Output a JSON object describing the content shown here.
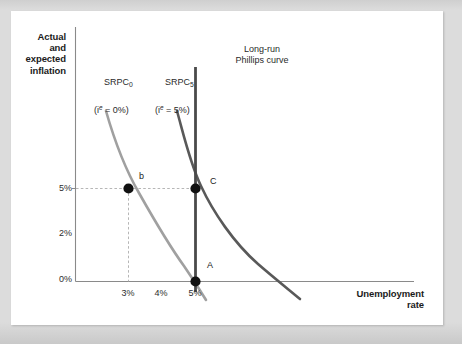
{
  "figure": {
    "background_color": "#dcdcdc",
    "card_color": "#ffffff"
  },
  "axes": {
    "y_title": "Actual\nand\nexpected\ninflation",
    "x_title": "Unemployment\nrate",
    "y_ticks": [
      "5%",
      "2%",
      "0%"
    ],
    "x_ticks": [
      "3%",
      "4%",
      "5%"
    ],
    "axis_color": "#8a8a8a"
  },
  "labels": {
    "srpc0_name": "SRPC",
    "srpc0_sub": "0",
    "srpc0_expectation": "(i",
    "srpc0_expectation_sup": "e",
    "srpc0_expectation_rest": " = 0%)",
    "srpc5_name": "SRPC",
    "srpc5_sub": "5",
    "srpc5_expectation": "(i",
    "srpc5_expectation_sup": "e",
    "srpc5_expectation_rest": " = 5%)",
    "lrpc_name": "Long-run\nPhillips curve",
    "point_b": "b",
    "point_C": "C",
    "point_A": "A"
  },
  "chart_data": {
    "type": "line",
    "title": "",
    "xlabel": "Unemployment rate",
    "ylabel": "Actual and expected inflation",
    "xlim": [
      1.6,
      8.2
    ],
    "ylim": [
      -1.8,
      9.0
    ],
    "grid": false,
    "legend": "inline-annotations",
    "x_tick_values": [
      3,
      4,
      5
    ],
    "x_tick_labels": [
      "3%",
      "4%",
      "5%"
    ],
    "y_tick_values": [
      0,
      2,
      5
    ],
    "y_tick_labels": [
      "0%",
      "2%",
      "5%"
    ],
    "series": [
      {
        "name": "SRPC0",
        "label": "SRPC0 (ie = 0%)",
        "color": "#9d9d9d",
        "type": "curve",
        "description": "Short-run Phillips curve with expected inflation of 0%",
        "points": [
          {
            "u": 2.35,
            "pi": 7.6
          },
          {
            "u": 2.6,
            "pi": 6.4
          },
          {
            "u": 3.0,
            "pi": 5.0
          },
          {
            "u": 3.5,
            "pi": 3.5
          },
          {
            "u": 4.0,
            "pi": 2.3
          },
          {
            "u": 4.5,
            "pi": 1.1
          },
          {
            "u": 5.0,
            "pi": 0.0
          },
          {
            "u": 5.5,
            "pi": -1.1
          },
          {
            "u": 5.85,
            "pi": -1.7
          }
        ]
      },
      {
        "name": "SRPC5",
        "label": "SRPC5 (ie = 5%)",
        "color": "#5a5a5a",
        "type": "curve",
        "description": "Short-run Phillips curve with expected inflation of 5%",
        "points": [
          {
            "u": 4.28,
            "pi": 7.6
          },
          {
            "u": 4.5,
            "pi": 6.5
          },
          {
            "u": 5.0,
            "pi": 5.0
          },
          {
            "u": 5.6,
            "pi": 3.3
          },
          {
            "u": 6.2,
            "pi": 1.9
          },
          {
            "u": 6.8,
            "pi": 0.8
          },
          {
            "u": 7.3,
            "pi": 0.0
          },
          {
            "u": 7.9,
            "pi": -1.1
          },
          {
            "u": 8.15,
            "pi": -1.6
          }
        ]
      },
      {
        "name": "LRPC",
        "label": "Long-run Phillips curve",
        "color": "#4a4a4a",
        "type": "vertical-line",
        "description": "Long-run Phillips curve, vertical at the natural rate of unemployment",
        "x": 5.0,
        "y_from": -0.45,
        "y_to": 8.55
      }
    ],
    "points": [
      {
        "name": "b",
        "u": 3.0,
        "pi": 5.0,
        "on": "SRPC0",
        "color": "#111111"
      },
      {
        "name": "C",
        "u": 5.0,
        "pi": 5.0,
        "on": "SRPC5 and LRPC",
        "color": "#111111"
      },
      {
        "name": "A",
        "u": 5.0,
        "pi": 0.0,
        "on": "SRPC0 and LRPC",
        "color": "#111111"
      }
    ],
    "guide_lines": [
      {
        "type": "horizontal-dashed",
        "pi": 5.0,
        "from_u": 1.95,
        "to_u": 5.0
      },
      {
        "type": "vertical-dashed",
        "u": 3.0,
        "from_pi": 0.0,
        "to_pi": 5.0
      }
    ]
  }
}
